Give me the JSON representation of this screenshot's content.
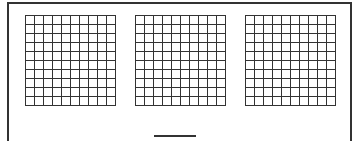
{
  "worksheet": {
    "grids": [
      {
        "rows": 10,
        "cols": 10,
        "left": 25
      },
      {
        "rows": 10,
        "cols": 10,
        "left": 135
      },
      {
        "rows": 10,
        "cols": 10,
        "left": 245
      }
    ],
    "answer_blank": ""
  }
}
